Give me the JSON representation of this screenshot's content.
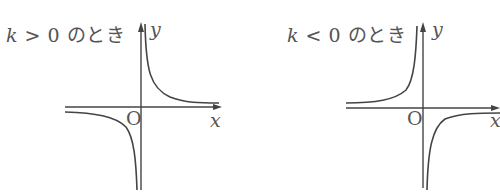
{
  "graphs": [
    {
      "title_k": "k",
      "title_rest": " > 0 のとき",
      "axis_x": "x",
      "axis_y": "y",
      "origin": "O",
      "case": "k>0",
      "branches": "quadrants I and III"
    },
    {
      "title_k": "k",
      "title_rest": " < 0 のとき",
      "axis_x": "x",
      "axis_y": "y",
      "origin": "O",
      "case": "k<0",
      "branches": "quadrants II and IV"
    }
  ],
  "colors": {
    "ink": "#444444",
    "text": "#555555"
  }
}
